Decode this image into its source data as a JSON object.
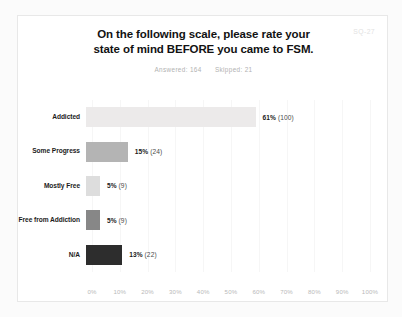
{
  "chart_data": {
    "type": "bar",
    "orientation": "horizontal",
    "title": "On the following scale, please rate your state of mind BEFORE you came to FSM.",
    "title_line1": "On the following scale, please rate your",
    "title_line2": "state of mind BEFORE you came to FSM.",
    "subtitle": "Answered: 164   Skipped: 21",
    "answered_label": "Answered: 164",
    "skipped_label": "Skipped: 21",
    "answered_count": 164,
    "skipped_count": 21,
    "corner_code": "SQ-27",
    "categories": [
      "Addicted",
      "Some Progress",
      "Mostly Free",
      "Free from Addiction",
      "N/A"
    ],
    "values": [
      61,
      15,
      5,
      5,
      13
    ],
    "counts": [
      100,
      24,
      9,
      9,
      22
    ],
    "value_labels": [
      "61%",
      "15%",
      "5%",
      "5%",
      "13%"
    ],
    "count_labels": [
      "(100)",
      "(24)",
      "(9)",
      "(9)",
      "(22)"
    ],
    "bar_colors": [
      "#eceaea",
      "#b4b4b4",
      "#dddddd",
      "#878787",
      "#2d2d2d"
    ],
    "xlabel": "",
    "ylabel": "",
    "xlim": [
      0,
      100
    ],
    "x_ticks": [
      0,
      10,
      20,
      30,
      40,
      50,
      60,
      70,
      80,
      90,
      100
    ],
    "x_tick_labels": [
      "0%",
      "10%",
      "20%",
      "30%",
      "40%",
      "50%",
      "60%",
      "70%",
      "80%",
      "90%",
      "100%"
    ],
    "grid": true,
    "legend": false
  }
}
